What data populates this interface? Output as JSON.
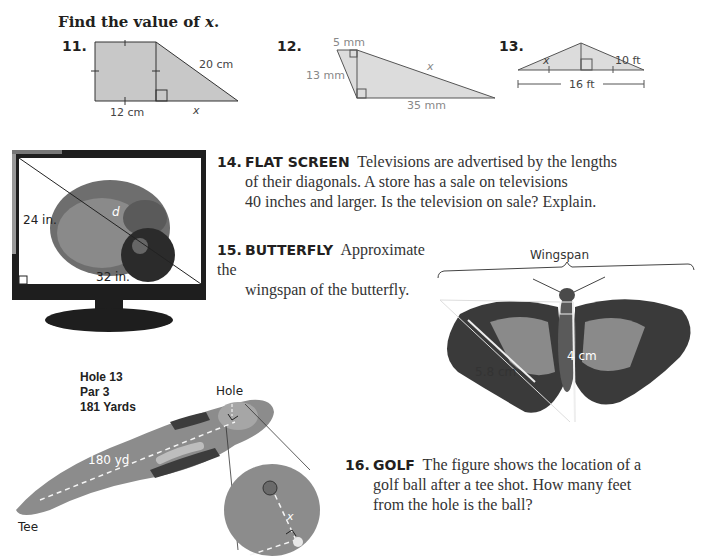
{
  "heading": {
    "prefix": "Find the value of ",
    "variable": "x",
    "suffix": "."
  },
  "exercises": [
    {
      "number": "11.",
      "figure": "trapezoid-square-right-triangle",
      "labels": {
        "bottom_left": "12 cm",
        "hypotenuse": "20 cm",
        "unknown": "x"
      }
    },
    {
      "number": "12.",
      "figure": "two-right-triangles",
      "labels": {
        "top": "5 mm",
        "left": "13 mm",
        "hypotenuse": "x",
        "bottom": "35 mm"
      }
    },
    {
      "number": "13.",
      "figure": "isosceles-triangle-altitude",
      "labels": {
        "left_side": "x",
        "right_side": "10 ft",
        "base": "16 ft"
      }
    }
  ],
  "problems": [
    {
      "number": "14.",
      "keyword": "FLAT SCREEN",
      "lines": [
        "Televisions are advertised by the lengths",
        "of their diagonals. A store has a sale on televisions",
        "40 inches and larger. Is the television on sale? Explain."
      ],
      "figure": {
        "type": "television-hedgehog-photo",
        "labels": {
          "height": "24 in.",
          "width": "32 in.",
          "diagonal": "d"
        }
      }
    },
    {
      "number": "15.",
      "keyword": "BUTTERFLY",
      "lines": [
        "Approximate the",
        "wingspan of the butterfly."
      ],
      "figure": {
        "type": "butterfly-photo",
        "labels": {
          "span": "Wingspan",
          "wing_edge": "5.8 cm",
          "body": "4 cm"
        }
      }
    },
    {
      "number": "16.",
      "keyword": "GOLF",
      "lines": [
        "The figure shows the location of a",
        "golf ball after a tee shot. How many feet",
        "from the hole is the ball?"
      ],
      "figure": {
        "type": "golf-hole-map",
        "labels": {
          "hole_number": "Hole 13",
          "par": "Par 3",
          "yards": "181 Yards",
          "hole": "Hole",
          "distance": "180 yd",
          "tee": "Tee",
          "unknown": "x"
        }
      }
    }
  ]
}
